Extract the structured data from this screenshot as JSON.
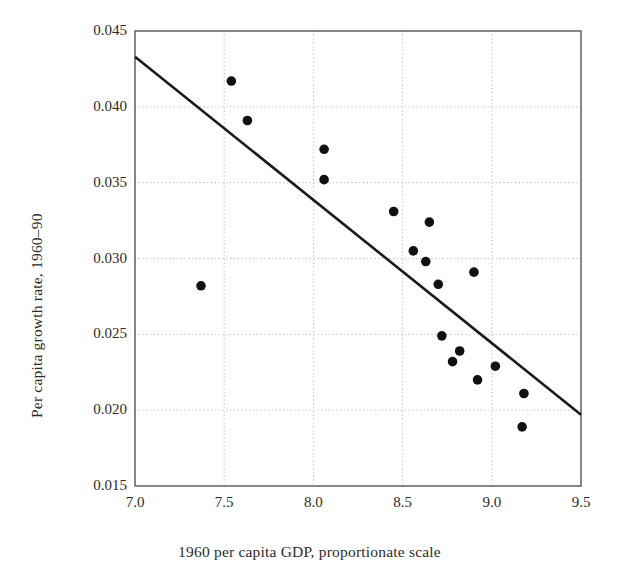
{
  "figure": {
    "background": "#ffffff",
    "point_color": "#111111",
    "line_color": "#1a1a1a",
    "grid_color": "#b9b9b9",
    "frame_color": "#555555"
  },
  "chart_data": {
    "type": "scatter",
    "title": "",
    "xlabel": "1960 per capita GDP, proportionate scale",
    "ylabel": "Per capita growth rate, 1960–90",
    "xlim": [
      7.0,
      9.5
    ],
    "ylim": [
      0.015,
      0.045
    ],
    "xticks": [
      7.0,
      7.5,
      8.0,
      8.5,
      9.0,
      9.5
    ],
    "yticks": [
      0.015,
      0.02,
      0.025,
      0.03,
      0.035,
      0.04,
      0.045
    ],
    "xticklabels": [
      "7.0",
      "7.5",
      "8.0",
      "8.5",
      "9.0",
      "9.5"
    ],
    "yticklabels": [
      "0.015",
      "0.020",
      "0.025",
      "0.030",
      "0.035",
      "0.040",
      "0.045"
    ],
    "grid": true,
    "grid_style": "dotted",
    "legend": null,
    "marker": "filled-circle",
    "marker_size": 7,
    "points": [
      {
        "x": 7.37,
        "y": 0.0282
      },
      {
        "x": 7.54,
        "y": 0.0417
      },
      {
        "x": 7.63,
        "y": 0.0391
      },
      {
        "x": 8.06,
        "y": 0.0372
      },
      {
        "x": 8.06,
        "y": 0.0352
      },
      {
        "x": 8.45,
        "y": 0.0331
      },
      {
        "x": 8.65,
        "y": 0.0324
      },
      {
        "x": 8.56,
        "y": 0.0305
      },
      {
        "x": 8.63,
        "y": 0.0298
      },
      {
        "x": 8.7,
        "y": 0.0283
      },
      {
        "x": 8.9,
        "y": 0.0291
      },
      {
        "x": 8.72,
        "y": 0.0249
      },
      {
        "x": 8.82,
        "y": 0.0239
      },
      {
        "x": 8.78,
        "y": 0.0232
      },
      {
        "x": 9.02,
        "y": 0.0229
      },
      {
        "x": 8.92,
        "y": 0.022
      },
      {
        "x": 9.18,
        "y": 0.0211
      },
      {
        "x": 9.17,
        "y": 0.0189
      }
    ],
    "trend_line": {
      "type": "line",
      "x0": 7.0,
      "y0": 0.0433,
      "x1": 9.5,
      "y1": 0.0197,
      "width": 2.6
    }
  }
}
